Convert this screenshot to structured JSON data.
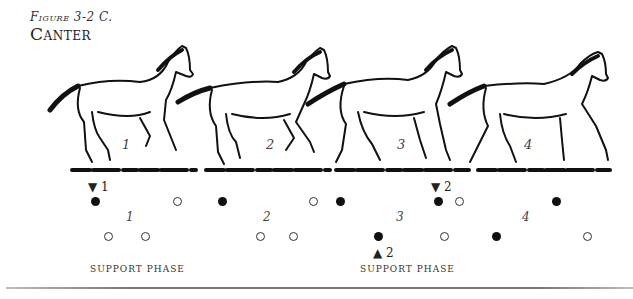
{
  "figure": {
    "label": "Figure 3-2 C.",
    "title": "Canter"
  },
  "horses": [
    {
      "number": "1",
      "x": 122,
      "y": 146
    },
    {
      "number": "2",
      "x": 266,
      "y": 146
    },
    {
      "number": "3",
      "x": 397,
      "y": 146
    },
    {
      "number": "4",
      "x": 524,
      "y": 146
    }
  ],
  "markers": [
    {
      "symbol": "▼",
      "label": "1",
      "x": 91,
      "y": 180
    },
    {
      "symbol": "▼",
      "label": "2",
      "x": 432,
      "y": 180
    },
    {
      "symbol": "▲",
      "label": "2",
      "x": 374,
      "y": 248
    }
  ],
  "footfalls": {
    "row1": [
      {
        "type": "filled",
        "x": 91,
        "y": 198
      },
      {
        "type": "open",
        "x": 173,
        "y": 198
      },
      {
        "type": "filled",
        "x": 218,
        "y": 198
      },
      {
        "type": "open",
        "x": 309,
        "y": 198
      },
      {
        "type": "filled",
        "x": 336,
        "y": 198
      },
      {
        "type": "filled",
        "x": 434,
        "y": 198
      },
      {
        "type": "open",
        "x": 455,
        "y": 198
      },
      {
        "type": "filled",
        "x": 552,
        "y": 198
      }
    ],
    "row2": [
      {
        "type": "open",
        "x": 104,
        "y": 233
      },
      {
        "type": "open",
        "x": 141,
        "y": 233
      },
      {
        "type": "open",
        "x": 256,
        "y": 233
      },
      {
        "type": "open",
        "x": 289,
        "y": 233
      },
      {
        "type": "filled",
        "x": 374,
        "y": 233
      },
      {
        "type": "open",
        "x": 440,
        "y": 233
      },
      {
        "type": "filled",
        "x": 492,
        "y": 233
      },
      {
        "type": "open",
        "x": 583,
        "y": 233
      }
    ]
  },
  "phase_numbers": [
    {
      "label": "1",
      "x": 126,
      "y": 211
    },
    {
      "label": "2",
      "x": 263,
      "y": 211
    },
    {
      "label": "3",
      "x": 396,
      "y": 211
    },
    {
      "label": "4",
      "x": 522,
      "y": 211
    }
  ],
  "support_labels": [
    {
      "text": "Support Phase",
      "x": 90,
      "y": 263
    },
    {
      "text": "Support Phase",
      "x": 360,
      "y": 263
    }
  ]
}
